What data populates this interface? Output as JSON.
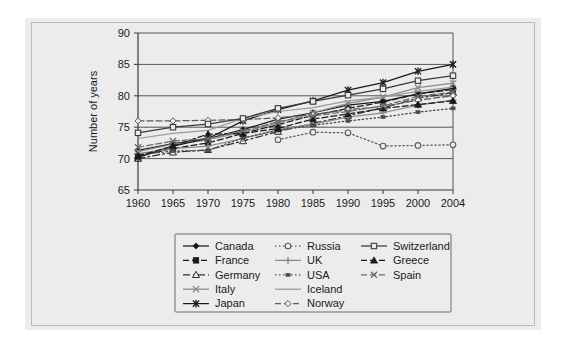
{
  "figure": {
    "background_color": "#ffffff",
    "panel_color": "#ececec",
    "frame_color": "#b9b9b9"
  },
  "chart_data": {
    "type": "line",
    "title": "",
    "subtitle": "",
    "xlabel": "",
    "ylabel": "Number of years",
    "x": [
      1960,
      1965,
      1970,
      1975,
      1980,
      1985,
      1990,
      1995,
      2000,
      2004
    ],
    "tick_labels_x": [
      "1960",
      "1965",
      "1970",
      "1975",
      "1980",
      "1985",
      "1990",
      "1995",
      "2000",
      "2004"
    ],
    "tick_labels_y": [
      "65",
      "70",
      "75",
      "80",
      "85",
      "90"
    ],
    "ylim": [
      65,
      90
    ],
    "yticks": [
      65,
      70,
      75,
      80,
      85,
      90
    ],
    "grid": "horizontal",
    "legend_position": "bottom",
    "series": [
      {
        "name": "Canada",
        "marker": "filled-diamond",
        "dash": "none",
        "color": "#1a1a1a",
        "values": [
          71.3,
          72.4,
          73.2,
          74.6,
          76.3,
          77.3,
          78.5,
          79.1,
          80.3,
          81.2
        ]
      },
      {
        "name": "France",
        "marker": "filled-square",
        "dash": "dashed",
        "color": "#1a1a1a",
        "values": [
          70.4,
          71.6,
          72.5,
          74.0,
          75.4,
          76.9,
          78.0,
          79.0,
          80.3,
          81.0
        ]
      },
      {
        "name": "Germany",
        "marker": "open-triangle",
        "dash": "dash-dot",
        "color": "#2e2e2e",
        "values": [
          70.0,
          71.0,
          71.4,
          72.8,
          74.3,
          75.6,
          76.8,
          78.1,
          79.6,
          80.5
        ]
      },
      {
        "name": "Italy",
        "marker": "cross-x",
        "dash": "none",
        "color": "#8a8a8a",
        "values": [
          71.1,
          72.3,
          73.0,
          74.2,
          75.7,
          77.3,
          78.8,
          79.8,
          81.3,
          82.0
        ]
      },
      {
        "name": "Japan",
        "marker": "asterisk",
        "dash": "none",
        "color": "#1a1a1a",
        "values": [
          70.2,
          72.0,
          73.2,
          76.0,
          77.8,
          79.2,
          80.9,
          82.1,
          83.9,
          85.0
        ]
      },
      {
        "name": "Russia",
        "marker": "open-circle",
        "dash": "dotted",
        "color": "#5a5a5a",
        "values": [
          null,
          null,
          null,
          null,
          73.0,
          74.2,
          74.1,
          72.0,
          72.1,
          72.2
        ]
      },
      {
        "name": "UK",
        "marker": "plus",
        "dash": "none",
        "color": "#8a8a8a",
        "values": [
          70.8,
          71.6,
          72.0,
          73.2,
          74.6,
          75.5,
          76.6,
          77.3,
          78.5,
          79.3
        ]
      },
      {
        "name": "USA",
        "marker": "small-filled",
        "dash": "dotted",
        "color": "#4a4a4a",
        "values": [
          70.6,
          71.2,
          71.3,
          73.3,
          74.5,
          75.3,
          76.0,
          76.6,
          77.4,
          78.0
        ]
      },
      {
        "name": "Iceland",
        "marker": "none",
        "dash": "none",
        "color": "#9a9a9a",
        "values": [
          73.2,
          74.0,
          74.5,
          76.4,
          77.5,
          78.1,
          79.2,
          79.8,
          80.7,
          81.4
        ]
      },
      {
        "name": "Norway",
        "marker": "open-diamond",
        "dash": "dashed",
        "color": "#5a5a5a",
        "values": [
          76.0,
          76.0,
          76.1,
          76.2,
          76.5,
          77.0,
          77.8,
          78.3,
          79.3,
          80.0
        ]
      },
      {
        "name": "Switzerland",
        "marker": "open-square",
        "dash": "none",
        "color": "#3a3a3a",
        "values": [
          74.1,
          75.0,
          75.5,
          76.4,
          78.0,
          79.1,
          80.1,
          81.1,
          82.4,
          83.2
        ]
      },
      {
        "name": "Greece",
        "marker": "filled-triangle",
        "dash": "dashed",
        "color": "#1a1a1a",
        "values": [
          70.4,
          72.0,
          73.9,
          74.0,
          74.8,
          76.3,
          77.1,
          78.0,
          78.6,
          79.2
        ]
      },
      {
        "name": "Spain",
        "marker": "cross-x",
        "dash": "dashed",
        "color": "#6a6a6a",
        "values": [
          71.8,
          72.8,
          73.2,
          74.4,
          75.9,
          76.8,
          77.5,
          78.4,
          79.9,
          80.6
        ]
      }
    ]
  },
  "legend": {
    "columns": [
      [
        "Canada",
        "France",
        "Germany",
        "Italy",
        "Japan"
      ],
      [
        "Russia",
        "UK",
        "USA",
        "Iceland",
        "Norway"
      ],
      [
        "Switzerland",
        "Greece",
        "Spain"
      ]
    ]
  }
}
